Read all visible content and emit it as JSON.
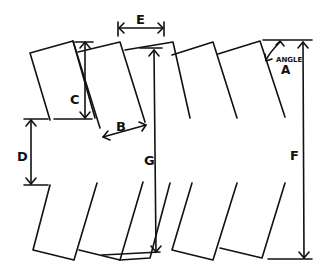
{
  "diagram": {
    "labels": {
      "A": "ANGLE",
      "A_letter": "A",
      "B": "B",
      "C": "C",
      "D": "D",
      "E": "E",
      "F": "F",
      "G": "G"
    },
    "colors": {
      "ink": "#111111",
      "background": "#ffffff"
    }
  }
}
